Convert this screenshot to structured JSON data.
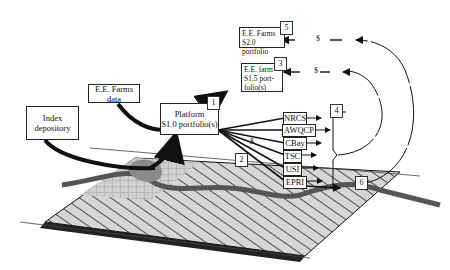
{
  "diagram": {
    "nodes": {
      "index_depository": {
        "line1": "Index",
        "line2": "depository"
      },
      "ee_farms_data": {
        "label": "E.E. Farms data"
      },
      "platform": {
        "line1": "Platform",
        "line2": "S1.0 portfolio(s)",
        "number": "1"
      },
      "ee_farm_s15": {
        "line1": "E.E. farm",
        "line2": "S1.5 port-",
        "line3": "folio(s)",
        "number": "3"
      },
      "ee_farms_s20": {
        "line1": "E.E. Farms",
        "line2": "S2.0 portfolio",
        "number": "5"
      }
    },
    "organizations": [
      "NRCS",
      "AWQCP",
      "CBay",
      "TSC",
      "USI",
      "EPRI"
    ],
    "step_numbers": {
      "two": "2",
      "four": "4",
      "six": "6"
    },
    "payment_symbol": "$",
    "colors": {
      "line": "#111111",
      "field": "#d4d4d4",
      "river": "#555555",
      "pond": "#8a8a8a"
    }
  }
}
